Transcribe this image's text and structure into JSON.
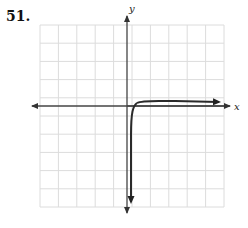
{
  "problem": {
    "number": "51."
  },
  "chart_data": {
    "type": "line",
    "title": "",
    "xlabel": "x",
    "ylabel": "y",
    "grid": true,
    "grid_cells": {
      "x": 10,
      "y": 10
    },
    "xlim": [
      -5,
      5
    ],
    "ylim": [
      -5,
      5
    ],
    "axis_arrows": {
      "x": "both",
      "y": "both"
    },
    "series": [
      {
        "name": "curve",
        "description": "Logarithmic-type curve with vertical asymptote just right of the y-axis; decreases steeply toward -infinity near the asymptote and levels off to the right just above the x-axis",
        "vertical_asymptote_x": 0.2,
        "points": [
          {
            "x": 0.2,
            "y": -5.5
          },
          {
            "x": 0.25,
            "y": -2
          },
          {
            "x": 0.4,
            "y": -0.3
          },
          {
            "x": 0.6,
            "y": 0.1
          },
          {
            "x": 1,
            "y": 0.2
          },
          {
            "x": 2,
            "y": 0.25
          },
          {
            "x": 3,
            "y": 0.25
          },
          {
            "x": 5,
            "y": 0.3
          }
        ],
        "end_arrows": [
          "down",
          "right"
        ]
      }
    ]
  },
  "colors": {
    "grid": "#dcdcdc",
    "axis": "#444444",
    "curve": "#2a2a2a"
  }
}
